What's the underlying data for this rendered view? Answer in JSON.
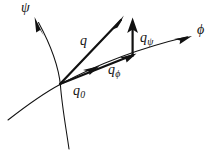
{
  "figure": {
    "background_color": "#ffffff",
    "ink_color": "#111111",
    "width": 218,
    "height": 150,
    "axes": [
      {
        "name": "psi-coordinate-curve",
        "label": "ψ",
        "label_position": [
          26,
          8
        ],
        "arrow_tip": [
          35,
          18
        ],
        "description": "curve rising steeply to upper-left, continues below origin"
      },
      {
        "name": "phi-coordinate-curve",
        "label": "ϕ",
        "label_position": [
          203,
          31
        ],
        "arrow_tip": [
          190,
          36
        ],
        "description": "curve rising gently to the right, continues below-left of origin"
      }
    ],
    "origin": {
      "label_main": "q",
      "label_sub": "0",
      "position": [
        60,
        84
      ]
    },
    "vectors": [
      {
        "name": "q-vector",
        "label_main": "q",
        "label_sub": "",
        "from": [
          60,
          84
        ],
        "to": [
          122,
          18
        ],
        "style": "thick solid with arrowhead at tip"
      },
      {
        "name": "q-phi-component",
        "label_main": "q",
        "label_sub": "ϕ",
        "from": [
          60,
          84
        ],
        "to": [
          133,
          55
        ],
        "style": "thick solid, mid arrowhead and tip arrowhead, tangent to phi curve"
      },
      {
        "name": "q-psi-component",
        "label_main": "q",
        "label_sub": "ψ",
        "from": [
          133,
          55
        ],
        "to": [
          133,
          20
        ],
        "style": "thick solid vertical with arrowhead at tip"
      }
    ]
  },
  "labels": {
    "psi_axis": "ψ",
    "phi_axis": "ϕ",
    "q": "q",
    "q_zero_base": "q",
    "q_zero_sub": "0",
    "q_phi_base": "q",
    "q_phi_sub": "ϕ",
    "q_psi_base": "q",
    "q_psi_sub": "ψ"
  }
}
